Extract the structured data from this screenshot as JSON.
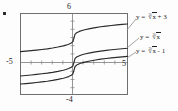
{
  "figure": {
    "bullet_marker": "•"
  },
  "axes": {
    "top_label": "6",
    "bottom_label": "-4",
    "left_label": "-5",
    "right_label": "5"
  },
  "labels": {
    "curve1": {
      "lhs": "y =",
      "index": "3",
      "radical": "√",
      "radicand": "x",
      "tail": "+ 3"
    },
    "curve2": {
      "lhs": "y =",
      "index": "3",
      "radical": "√",
      "radicand": "x",
      "tail": ""
    },
    "curve3": {
      "lhs": "y =",
      "index": "3",
      "radical": "√",
      "radicand": "x",
      "tail": "- 1"
    }
  },
  "colors": {
    "frame": "#6f6f6f",
    "axis": "#8a8a8a",
    "curve": "#2a2a2a",
    "leader": "#8d8d8d",
    "text": "#1c1c1c"
  },
  "chart_data": {
    "type": "line",
    "title": "",
    "xlabel": "",
    "ylabel": "",
    "xlim": [
      -5,
      5
    ],
    "ylim": [
      -4,
      6
    ],
    "grid": false,
    "legend_position": "right-outside-leader-lines",
    "x": [
      -5,
      -4.5,
      -4,
      -3.5,
      -3,
      -2.5,
      -2,
      -1.5,
      -1,
      -0.75,
      -0.5,
      -0.25,
      -0.1,
      0,
      0.1,
      0.25,
      0.5,
      0.75,
      1,
      1.5,
      2,
      2.5,
      3,
      3.5,
      4,
      4.5,
      5
    ],
    "series": [
      {
        "name": "y = cbrt(x) + 3",
        "label": "y = ∛ x + 3",
        "values": [
          1.29,
          1.35,
          1.41,
          1.48,
          1.56,
          1.64,
          1.74,
          1.86,
          2.0,
          2.09,
          2.21,
          2.37,
          2.54,
          3.0,
          3.46,
          3.63,
          3.79,
          3.91,
          4.0,
          4.14,
          4.26,
          4.36,
          4.44,
          4.52,
          4.59,
          4.65,
          4.71
        ]
      },
      {
        "name": "y = cbrt(x)",
        "label": "y = ∛ x",
        "values": [
          -1.71,
          -1.65,
          -1.59,
          -1.52,
          -1.44,
          -1.36,
          -1.26,
          -1.14,
          -1.0,
          -0.91,
          -0.79,
          -0.63,
          -0.46,
          0.0,
          0.46,
          0.63,
          0.79,
          0.91,
          1.0,
          1.14,
          1.26,
          1.36,
          1.44,
          1.52,
          1.59,
          1.65,
          1.71
        ]
      },
      {
        "name": "y = cbrt(x) - 1",
        "label": "y = ∛ x - 1",
        "values": [
          -2.71,
          -2.65,
          -2.59,
          -2.52,
          -2.44,
          -2.36,
          -2.26,
          -2.14,
          -2.0,
          -1.91,
          -1.79,
          -1.63,
          -1.46,
          -1.0,
          -0.54,
          -0.37,
          -0.21,
          -0.09,
          0.0,
          0.14,
          0.26,
          0.36,
          0.44,
          0.52,
          0.59,
          0.65,
          0.71
        ]
      }
    ]
  }
}
